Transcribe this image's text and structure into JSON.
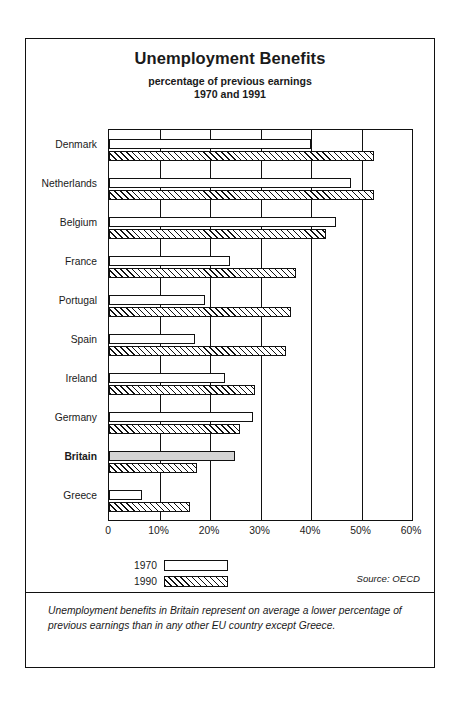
{
  "chart_data": {
    "type": "bar",
    "orientation": "horizontal",
    "title": "Unemployment Benefits",
    "subtitle_1": "percentage of previous earnings",
    "subtitle_2": "1970 and 1991",
    "xlabel": "",
    "ylabel": "",
    "xlim": [
      0,
      60
    ],
    "grid": true,
    "legend_position": "below-axis-left",
    "categories": [
      "Denmark",
      "Netherlands",
      "Belgium",
      "France",
      "Portugal",
      "Spain",
      "Ireland",
      "Germany",
      "Britain",
      "Greece"
    ],
    "highlight_category": "Britain",
    "series": [
      {
        "name": "1970",
        "style": "outline",
        "values": [
          40,
          48,
          45,
          24,
          19,
          17,
          23,
          28.5,
          25,
          6.5
        ]
      },
      {
        "name": "1990",
        "style": "hatched",
        "values": [
          52.5,
          52.5,
          43,
          37,
          36,
          35,
          29,
          26,
          17.5,
          16
        ]
      }
    ],
    "x_ticks": [
      {
        "value": 0,
        "label": "0"
      },
      {
        "value": 10,
        "label": "10%"
      },
      {
        "value": 20,
        "label": "20%"
      },
      {
        "value": 30,
        "label": "30%"
      },
      {
        "value": 40,
        "label": "40%"
      },
      {
        "value": 50,
        "label": "50%"
      },
      {
        "value": 60,
        "label": "60%"
      }
    ],
    "legend": [
      {
        "label": "1970",
        "style": "outline"
      },
      {
        "label": "1990",
        "style": "hatched"
      }
    ],
    "source_note": "Source: OECD",
    "caption": "Unemployment benefits in Britain represent on average a lower percentage of previous earnings than in any other EU country except Greece."
  }
}
